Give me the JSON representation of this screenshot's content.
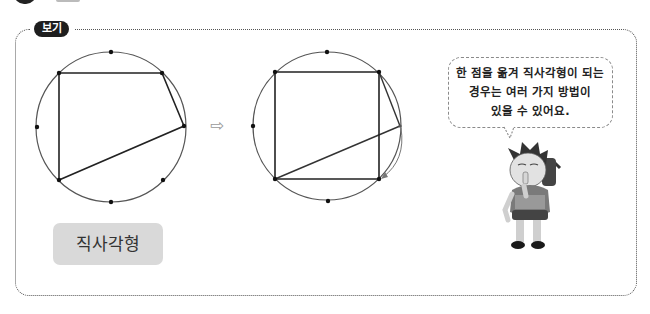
{
  "header": {
    "cut_off": true
  },
  "panel": {
    "label": "보기",
    "arrow_icon": "⇨",
    "answer": "직사각형",
    "speech_bubble": {
      "lines": [
        "한 점을 옮겨 직사각형이 되는",
        "경우는 여러 가지 방법이",
        "있을 수 있어요."
      ]
    },
    "figures": [
      {
        "name": "before",
        "circle": {
          "cx": 111,
          "cy": 127,
          "r": 75
        },
        "points": [
          [
            111,
            52
          ],
          [
            59,
            73
          ],
          [
            162,
            73
          ],
          [
            37,
            127
          ],
          [
            184,
            126
          ],
          [
            59,
            180
          ],
          [
            163,
            180
          ],
          [
            111,
            202
          ]
        ],
        "quadrilateral": [
          [
            59,
            73
          ],
          [
            162,
            73
          ],
          [
            184,
            126
          ],
          [
            59,
            180
          ]
        ]
      },
      {
        "name": "after",
        "circle": {
          "cx": 327,
          "cy": 126,
          "r": 74
        },
        "points": [
          [
            327,
            52
          ],
          [
            275,
            72
          ],
          [
            379,
            72
          ],
          [
            253,
            126
          ],
          [
            400,
            126
          ],
          [
            275,
            179
          ],
          [
            379,
            179
          ],
          [
            328,
            201
          ]
        ],
        "quadrilateral": [
          [
            275,
            72
          ],
          [
            379,
            72
          ],
          [
            379,
            179
          ],
          [
            275,
            179
          ]
        ],
        "ghost_edges": [
          [
            [
              379,
              72
            ],
            [
              400,
              126
            ]
          ],
          [
            [
              400,
              126
            ],
            [
              275,
              179
            ]
          ]
        ],
        "move_arrow": {
          "from": [
            400,
            126
          ],
          "to": [
            380,
            178
          ]
        }
      }
    ]
  }
}
